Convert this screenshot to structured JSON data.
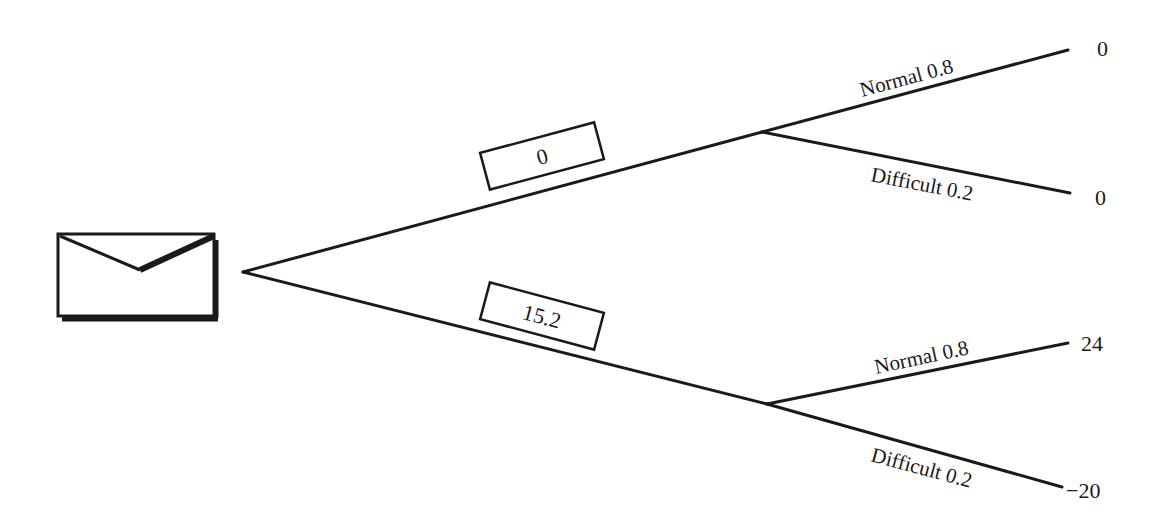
{
  "diagram": {
    "type": "decision-tree",
    "root": {
      "icon": "envelope-icon",
      "branches": [
        {
          "id": "upper",
          "value_box": "0",
          "chance_node": {
            "outcomes": [
              {
                "label": "Normal 0.8",
                "payoff": "0"
              },
              {
                "label": "Difficult 0.2",
                "payoff": "0"
              }
            ]
          }
        },
        {
          "id": "lower",
          "value_box": "15.2",
          "chance_node": {
            "outcomes": [
              {
                "label": "Normal 0.8",
                "payoff": "24"
              },
              {
                "label": "Difficult 0.2",
                "payoff": "−20"
              }
            ]
          }
        }
      ]
    },
    "colors": {
      "line": "#1a1a1a",
      "background": "#ffffff"
    }
  }
}
